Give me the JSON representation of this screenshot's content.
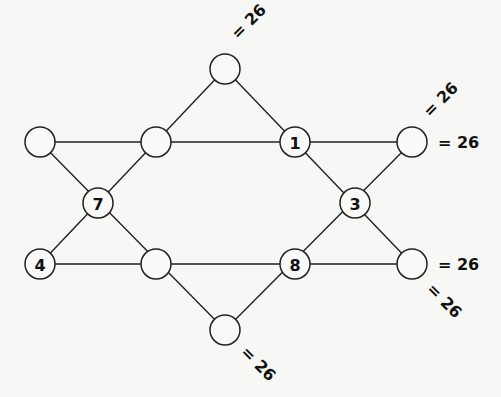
{
  "puzzle": {
    "type": "magic-star-hexagram",
    "target_sum": 26,
    "line_color": "#222222",
    "background": "#f7f7f5",
    "nodes": [
      {
        "id": "top",
        "x": 225,
        "y": 69,
        "value": ""
      },
      {
        "id": "row1-left",
        "x": 40,
        "y": 142,
        "value": ""
      },
      {
        "id": "row1-inner-l",
        "x": 156,
        "y": 142,
        "value": ""
      },
      {
        "id": "row1-inner-r",
        "x": 295,
        "y": 142,
        "value": "1"
      },
      {
        "id": "row1-right",
        "x": 412,
        "y": 142,
        "value": ""
      },
      {
        "id": "mid-left",
        "x": 98,
        "y": 203,
        "value": "7"
      },
      {
        "id": "mid-right",
        "x": 355,
        "y": 203,
        "value": "3"
      },
      {
        "id": "row3-left",
        "x": 40,
        "y": 264,
        "value": "4"
      },
      {
        "id": "row3-inner-l",
        "x": 156,
        "y": 264,
        "value": ""
      },
      {
        "id": "row3-inner-r",
        "x": 295,
        "y": 264,
        "value": "8"
      },
      {
        "id": "row3-right",
        "x": 412,
        "y": 264,
        "value": ""
      },
      {
        "id": "bottom",
        "x": 225,
        "y": 330,
        "value": ""
      }
    ],
    "lines": [
      {
        "name": "top-row",
        "from": [
          40,
          142
        ],
        "to": [
          412,
          142
        ]
      },
      {
        "name": "bottom-row",
        "from": [
          40,
          264
        ],
        "to": [
          412,
          264
        ]
      },
      {
        "name": "top-to-left",
        "from": [
          225,
          69
        ],
        "to": [
          40,
          264
        ]
      },
      {
        "name": "top-to-right",
        "from": [
          225,
          69
        ],
        "to": [
          412,
          264
        ]
      },
      {
        "name": "bottom-to-left",
        "from": [
          225,
          330
        ],
        "to": [
          40,
          142
        ]
      },
      {
        "name": "bottom-to-right",
        "from": [
          225,
          330
        ],
        "to": [
          412,
          142
        ]
      }
    ],
    "sum_labels": [
      {
        "text": "= 26",
        "x": 238,
        "y": 40,
        "rotate": -45
      },
      {
        "text": "= 26",
        "x": 430,
        "y": 118,
        "rotate": -45
      },
      {
        "text": "= 26",
        "x": 438,
        "y": 148,
        "rotate": 0
      },
      {
        "text": "= 26",
        "x": 438,
        "y": 270,
        "rotate": 0
      },
      {
        "text": "= 26",
        "x": 426,
        "y": 290,
        "rotate": 45
      },
      {
        "text": "= 26",
        "x": 240,
        "y": 353,
        "rotate": 45
      }
    ]
  }
}
